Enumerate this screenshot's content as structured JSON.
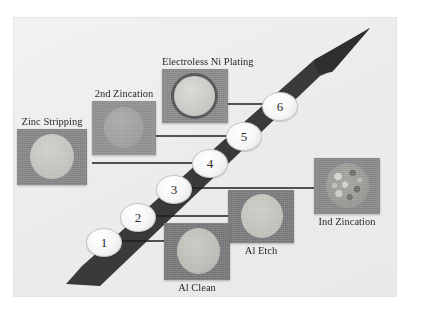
{
  "figure": {
    "kind": "process-flow-diagram",
    "background_color": "#efeff0",
    "arrow_color": "#3a3a3c",
    "badge_text_color": "#2c2c2c"
  },
  "steps": [
    {
      "number": "1",
      "label": "Al Clean",
      "label_position": "below",
      "surface": "smooth light disc on dark gray field"
    },
    {
      "number": "2",
      "label": "Al Etch",
      "label_position": "below",
      "surface": "smooth light disc on dark gray field"
    },
    {
      "number": "3",
      "label": "Ind Zincation",
      "label_position": "below",
      "surface": "mottled textured disc on gray field"
    },
    {
      "number": "4",
      "label": "Zinc Stripping",
      "label_position": "above",
      "surface": "pale disc on medium gray field"
    },
    {
      "number": "5",
      "label": "2nd Zincation",
      "label_position": "above",
      "surface": "gray disc on medium gray field"
    },
    {
      "number": "6",
      "label": "Electroless Ni Plating",
      "label_position": "above",
      "surface": "bright disc with dark rim on gray field"
    }
  ]
}
